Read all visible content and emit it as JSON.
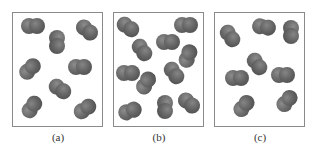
{
  "figure": {
    "atom_color": "#6b6b6b",
    "border_color": "#8a8a8a",
    "panels": [
      {
        "label": "(a)",
        "left": 12,
        "molecules": [
          {
            "x": 33,
            "y": 26,
            "angle": 0
          },
          {
            "x": 87,
            "y": 30,
            "angle": 40
          },
          {
            "x": 57,
            "y": 42,
            "angle": 90
          },
          {
            "x": 30,
            "y": 69,
            "angle": -45
          },
          {
            "x": 80,
            "y": 67,
            "angle": 0
          },
          {
            "x": 60,
            "y": 89,
            "angle": 35
          },
          {
            "x": 32,
            "y": 107,
            "angle": -55
          },
          {
            "x": 85,
            "y": 109,
            "angle": -35
          }
        ]
      },
      {
        "label": "(b)",
        "left": 113,
        "molecules": [
          {
            "x": 128,
            "y": 27,
            "angle": 35
          },
          {
            "x": 186,
            "y": 25,
            "angle": 0
          },
          {
            "x": 168,
            "y": 42,
            "angle": 0
          },
          {
            "x": 142,
            "y": 50,
            "angle": 55
          },
          {
            "x": 188,
            "y": 56,
            "angle": -70
          },
          {
            "x": 128,
            "y": 73,
            "angle": 0
          },
          {
            "x": 174,
            "y": 73,
            "angle": 55
          },
          {
            "x": 146,
            "y": 83,
            "angle": -60
          },
          {
            "x": 130,
            "y": 111,
            "angle": -20
          },
          {
            "x": 165,
            "y": 107,
            "angle": 90
          },
          {
            "x": 189,
            "y": 103,
            "angle": 40
          }
        ]
      },
      {
        "label": "(c)",
        "left": 214,
        "molecules": [
          {
            "x": 230,
            "y": 36,
            "angle": 55
          },
          {
            "x": 264,
            "y": 27,
            "angle": 10
          },
          {
            "x": 291,
            "y": 32,
            "angle": 90
          },
          {
            "x": 257,
            "y": 64,
            "angle": 55
          },
          {
            "x": 237,
            "y": 78,
            "angle": 0
          },
          {
            "x": 283,
            "y": 75,
            "angle": 0
          },
          {
            "x": 244,
            "y": 106,
            "angle": -50
          },
          {
            "x": 287,
            "y": 101,
            "angle": -50
          }
        ]
      }
    ]
  }
}
